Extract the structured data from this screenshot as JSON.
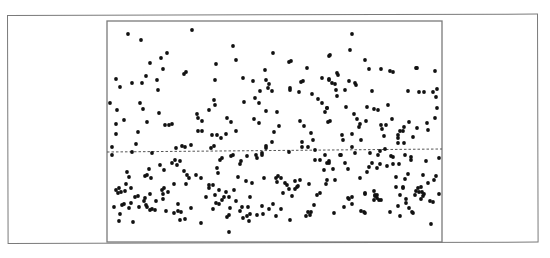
{
  "chart_data": {
    "type": "scatter",
    "title": "",
    "xlabel": "",
    "ylabel": "",
    "grid": false,
    "legend": null,
    "axis_ticks": "none",
    "colors": {
      "points": "#111111",
      "axes": "#7a7a7a",
      "reference_line": "#555555",
      "background": "#ffffff"
    },
    "plot_area_px": {
      "left": 107,
      "top": 21,
      "right": 442,
      "bottom": 242
    },
    "reference_line": {
      "style": "dashed",
      "y_px_left": 152,
      "y_px_right": 149
    },
    "points_px": [
      [
        128,
        34
      ],
      [
        141,
        40
      ],
      [
        192,
        30
      ],
      [
        167,
        53
      ],
      [
        161,
        58
      ],
      [
        150,
        63
      ],
      [
        163,
        69
      ],
      [
        146,
        76
      ],
      [
        184,
        74
      ],
      [
        186,
        72
      ],
      [
        216,
        64
      ],
      [
        116,
        79
      ],
      [
        120,
        87
      ],
      [
        132,
        83
      ],
      [
        142,
        83
      ],
      [
        157,
        80
      ],
      [
        158,
        90
      ],
      [
        215,
        80
      ],
      [
        110,
        103
      ],
      [
        117,
        110
      ],
      [
        140,
        103
      ],
      [
        143,
        109
      ],
      [
        165,
        125
      ],
      [
        159,
        113
      ],
      [
        147,
        122
      ],
      [
        169,
        125
      ],
      [
        172,
        124
      ],
      [
        124,
        120
      ],
      [
        116,
        124
      ],
      [
        116,
        134
      ],
      [
        138,
        132
      ],
      [
        136,
        144
      ],
      [
        112,
        147
      ],
      [
        132,
        152
      ],
      [
        152,
        153
      ],
      [
        185,
        147
      ],
      [
        182,
        146
      ],
      [
        198,
        131
      ],
      [
        202,
        131
      ],
      [
        198,
        118
      ],
      [
        197,
        114
      ],
      [
        212,
        135
      ],
      [
        214,
        146
      ],
      [
        211,
        148
      ],
      [
        217,
        135
      ],
      [
        214,
        100
      ],
      [
        215,
        105
      ],
      [
        209,
        110
      ],
      [
        202,
        121
      ],
      [
        191,
        145
      ],
      [
        176,
        148
      ],
      [
        112,
        155
      ],
      [
        172,
        163
      ],
      [
        175,
        160
      ],
      [
        177,
        165
      ],
      [
        180,
        161
      ],
      [
        160,
        165
      ],
      [
        164,
        170
      ],
      [
        149,
        169
      ],
      [
        145,
        176
      ],
      [
        129,
        177
      ],
      [
        127,
        172
      ],
      [
        147,
        175
      ],
      [
        151,
        178
      ],
      [
        116,
        190
      ],
      [
        118,
        193
      ],
      [
        121,
        192
      ],
      [
        119,
        188
      ],
      [
        125,
        191
      ],
      [
        131,
        188
      ],
      [
        126,
        184
      ],
      [
        138,
        196
      ],
      [
        150,
        194
      ],
      [
        162,
        190
      ],
      [
        164,
        188
      ],
      [
        168,
        192
      ],
      [
        174,
        184
      ],
      [
        186,
        184
      ],
      [
        187,
        175
      ],
      [
        184,
        171
      ],
      [
        189,
        178
      ],
      [
        196,
        175
      ],
      [
        201,
        178
      ],
      [
        209,
        185
      ],
      [
        213,
        185
      ],
      [
        218,
        173
      ],
      [
        220,
        160
      ],
      [
        209,
        188
      ],
      [
        215,
        195
      ],
      [
        114,
        207
      ],
      [
        122,
        205
      ],
      [
        124,
        204
      ],
      [
        120,
        214
      ],
      [
        119,
        221
      ],
      [
        133,
        222
      ],
      [
        135,
        197
      ],
      [
        131,
        203
      ],
      [
        129,
        208
      ],
      [
        139,
        207
      ],
      [
        144,
        201
      ],
      [
        147,
        207
      ],
      [
        146,
        205
      ],
      [
        145,
        198
      ],
      [
        150,
        210
      ],
      [
        152,
        209
      ],
      [
        155,
        210
      ],
      [
        156,
        201
      ],
      [
        163,
        199
      ],
      [
        163,
        194
      ],
      [
        166,
        211
      ],
      [
        178,
        204
      ],
      [
        174,
        213
      ],
      [
        178,
        211
      ],
      [
        181,
        212
      ],
      [
        180,
        220
      ],
      [
        185,
        219
      ],
      [
        191,
        208
      ],
      [
        201,
        223
      ],
      [
        206,
        197
      ],
      [
        213,
        209
      ],
      [
        216,
        203
      ],
      [
        233,
        46
      ],
      [
        236,
        60
      ],
      [
        273,
        53
      ],
      [
        243,
        78
      ],
      [
        253,
        81
      ],
      [
        266,
        80
      ],
      [
        265,
        70
      ],
      [
        269,
        84
      ],
      [
        268,
        88
      ],
      [
        272,
        91
      ],
      [
        289,
        62
      ],
      [
        291,
        61
      ],
      [
        290,
        88
      ],
      [
        290,
        90
      ],
      [
        301,
        82
      ],
      [
        303,
        81
      ],
      [
        307,
        68
      ],
      [
        322,
        78
      ],
      [
        329,
        80
      ],
      [
        329,
        56
      ],
      [
        227,
        118
      ],
      [
        231,
        122
      ],
      [
        236,
        131
      ],
      [
        226,
        134
      ],
      [
        221,
        138
      ],
      [
        255,
        98
      ],
      [
        259,
        103
      ],
      [
        260,
        91
      ],
      [
        244,
        102
      ],
      [
        254,
        119
      ],
      [
        259,
        123
      ],
      [
        266,
        111
      ],
      [
        277,
        112
      ],
      [
        279,
        126
      ],
      [
        274,
        132
      ],
      [
        272,
        142
      ],
      [
        266,
        146
      ],
      [
        266,
        148
      ],
      [
        299,
        92
      ],
      [
        312,
        94
      ],
      [
        318,
        99
      ],
      [
        322,
        103
      ],
      [
        327,
        108
      ],
      [
        325,
        112
      ],
      [
        330,
        121
      ],
      [
        300,
        121
      ],
      [
        304,
        126
      ],
      [
        311,
        133
      ],
      [
        313,
        140
      ],
      [
        302,
        142
      ],
      [
        302,
        147
      ],
      [
        308,
        147
      ],
      [
        315,
        150
      ],
      [
        289,
        152
      ],
      [
        262,
        153
      ],
      [
        222,
        158
      ],
      [
        231,
        156
      ],
      [
        233,
        155
      ],
      [
        241,
        161
      ],
      [
        240,
        164
      ],
      [
        247,
        156
      ],
      [
        256,
        155
      ],
      [
        262,
        155
      ],
      [
        257,
        158
      ],
      [
        217,
        168
      ],
      [
        238,
        177
      ],
      [
        246,
        181
      ],
      [
        252,
        183
      ],
      [
        264,
        178
      ],
      [
        276,
        178
      ],
      [
        278,
        176
      ],
      [
        281,
        178
      ],
      [
        277,
        182
      ],
      [
        285,
        183
      ],
      [
        287,
        185
      ],
      [
        295,
        181
      ],
      [
        297,
        187
      ],
      [
        309,
        184
      ],
      [
        292,
        196
      ],
      [
        289,
        189
      ],
      [
        300,
        180
      ],
      [
        298,
        186
      ],
      [
        283,
        193
      ],
      [
        320,
        193
      ],
      [
        320,
        160
      ],
      [
        324,
        170
      ],
      [
        329,
        163
      ],
      [
        325,
        155
      ],
      [
        315,
        160
      ],
      [
        226,
        192
      ],
      [
        234,
        190
      ],
      [
        219,
        190
      ],
      [
        224,
        197
      ],
      [
        250,
        197
      ],
      [
        219,
        204
      ],
      [
        222,
        200
      ],
      [
        229,
        197
      ],
      [
        236,
        201
      ],
      [
        230,
        208
      ],
      [
        227,
        217
      ],
      [
        229,
        215
      ],
      [
        242,
        207
      ],
      [
        240,
        211
      ],
      [
        243,
        218
      ],
      [
        247,
        216
      ],
      [
        249,
        221
      ],
      [
        248,
        207
      ],
      [
        250,
        214
      ],
      [
        257,
        215
      ],
      [
        263,
        214
      ],
      [
        262,
        206
      ],
      [
        269,
        209
      ],
      [
        273,
        204
      ],
      [
        276,
        216
      ],
      [
        281,
        209
      ],
      [
        295,
        189
      ],
      [
        290,
        220
      ],
      [
        314,
        205
      ],
      [
        308,
        212
      ],
      [
        306,
        216
      ],
      [
        310,
        215
      ],
      [
        311,
        212
      ],
      [
        317,
        195
      ],
      [
        229,
        232
      ],
      [
        352,
        34
      ],
      [
        350,
        50
      ],
      [
        330,
        55
      ],
      [
        365,
        60
      ],
      [
        369,
        69
      ],
      [
        381,
        69
      ],
      [
        390,
        71
      ],
      [
        393,
        72
      ],
      [
        416,
        68
      ],
      [
        417,
        68
      ],
      [
        435,
        71
      ],
      [
        337,
        73
      ],
      [
        338,
        75
      ],
      [
        329,
        79
      ],
      [
        332,
        83
      ],
      [
        335,
        84
      ],
      [
        349,
        81
      ],
      [
        355,
        83
      ],
      [
        356,
        85
      ],
      [
        336,
        90
      ],
      [
        345,
        90
      ],
      [
        372,
        91
      ],
      [
        408,
        91
      ],
      [
        419,
        92
      ],
      [
        424,
        92
      ],
      [
        437,
        89
      ],
      [
        337,
        96
      ],
      [
        327,
        108
      ],
      [
        328,
        122
      ],
      [
        346,
        107
      ],
      [
        354,
        114
      ],
      [
        357,
        119
      ],
      [
        367,
        107
      ],
      [
        374,
        109
      ],
      [
        378,
        110
      ],
      [
        388,
        105
      ],
      [
        360,
        124
      ],
      [
        366,
        121
      ],
      [
        359,
        127
      ],
      [
        342,
        135
      ],
      [
        343,
        140
      ],
      [
        352,
        134
      ],
      [
        361,
        140
      ],
      [
        381,
        125
      ],
      [
        382,
        129
      ],
      [
        386,
        125
      ],
      [
        384,
        136
      ],
      [
        392,
        119
      ],
      [
        398,
        135
      ],
      [
        400,
        131
      ],
      [
        404,
        127
      ],
      [
        409,
        122
      ],
      [
        403,
        131
      ],
      [
        398,
        138
      ],
      [
        413,
        137
      ],
      [
        417,
        128
      ],
      [
        427,
        123
      ],
      [
        428,
        130
      ],
      [
        435,
        118
      ],
      [
        437,
        108
      ],
      [
        436,
        97
      ],
      [
        433,
        92
      ],
      [
        398,
        143
      ],
      [
        404,
        143
      ],
      [
        380,
        151
      ],
      [
        385,
        149
      ],
      [
        352,
        147
      ],
      [
        341,
        155
      ],
      [
        355,
        153
      ],
      [
        370,
        153
      ],
      [
        378,
        155
      ],
      [
        340,
        155
      ],
      [
        327,
        163
      ],
      [
        329,
        161
      ],
      [
        333,
        169
      ],
      [
        345,
        163
      ],
      [
        348,
        169
      ],
      [
        360,
        178
      ],
      [
        367,
        172
      ],
      [
        369,
        167
      ],
      [
        372,
        163
      ],
      [
        377,
        168
      ],
      [
        380,
        164
      ],
      [
        387,
        166
      ],
      [
        391,
        156
      ],
      [
        393,
        157
      ],
      [
        405,
        155
      ],
      [
        393,
        164
      ],
      [
        399,
        164
      ],
      [
        411,
        157
      ],
      [
        405,
        179
      ],
      [
        408,
        174
      ],
      [
        411,
        160
      ],
      [
        423,
        175
      ],
      [
        428,
        183
      ],
      [
        434,
        180
      ],
      [
        436,
        176
      ],
      [
        439,
        158
      ],
      [
        426,
        161
      ],
      [
        396,
        177
      ],
      [
        396,
        187
      ],
      [
        403,
        187
      ],
      [
        400,
        195
      ],
      [
        403,
        188
      ],
      [
        418,
        188
      ],
      [
        419,
        192
      ],
      [
        424,
        194
      ],
      [
        421,
        187
      ],
      [
        374,
        191
      ],
      [
        375,
        195
      ],
      [
        377,
        195
      ],
      [
        365,
        193
      ],
      [
        335,
        180
      ],
      [
        327,
        180
      ],
      [
        326,
        184
      ],
      [
        348,
        198
      ],
      [
        334,
        213
      ],
      [
        344,
        207
      ],
      [
        349,
        199
      ],
      [
        352,
        204
      ],
      [
        361,
        211
      ],
      [
        364,
        212
      ],
      [
        365,
        213
      ],
      [
        365,
        194
      ],
      [
        375,
        196
      ],
      [
        377,
        198
      ],
      [
        379,
        200
      ],
      [
        381,
        200
      ],
      [
        390,
        212
      ],
      [
        398,
        206
      ],
      [
        400,
        216
      ],
      [
        406,
        203
      ],
      [
        406,
        199
      ],
      [
        412,
        212
      ],
      [
        413,
        213
      ],
      [
        409,
        208
      ],
      [
        415,
        195
      ],
      [
        416,
        191
      ],
      [
        421,
        199
      ],
      [
        422,
        192
      ],
      [
        423,
        196
      ],
      [
        430,
        201
      ],
      [
        433,
        202
      ],
      [
        439,
        194
      ],
      [
        431,
        224
      ],
      [
        374,
        200
      ],
      [
        352,
        197
      ]
    ]
  }
}
